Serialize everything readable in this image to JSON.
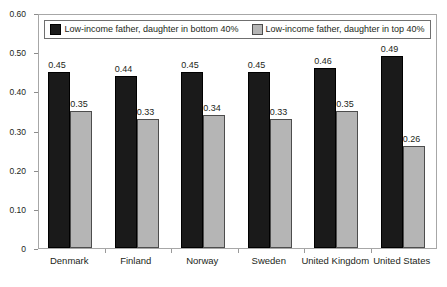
{
  "chart_data": {
    "type": "bar",
    "title": "",
    "subtitle": "",
    "xlabel": "",
    "ylabel": "",
    "categories": [
      "Denmark",
      "Finland",
      "Norway",
      "Sweden",
      "United Kingdom",
      "United States"
    ],
    "series": [
      {
        "name": "Low-income father, daughter in bottom 40%",
        "color": "#1a1a1a",
        "values": [
          0.45,
          0.44,
          0.45,
          0.45,
          0.46,
          0.49
        ],
        "labels": [
          "0.45",
          "0.44",
          "0.45",
          "0.45",
          "0.46",
          "0.49"
        ]
      },
      {
        "name": "Low-income father, daughter in top 40%",
        "color": "#b5b5b5",
        "values": [
          0.35,
          0.33,
          0.34,
          0.33,
          0.35,
          0.26
        ],
        "labels": [
          "0.35",
          "0.33",
          "0.34",
          "0.33",
          "0.35",
          "0.26"
        ]
      }
    ],
    "ylim": [
      0,
      0.6
    ],
    "yticks": [
      0,
      0.1,
      0.2,
      0.3,
      0.4,
      0.5,
      0.6
    ],
    "ytick_labels": [
      "0",
      "0.10",
      "0.20",
      "0.30",
      "0.40",
      "0.50",
      "0.60"
    ],
    "grid": false,
    "legend_position": "top-inside",
    "bar_group_order": [
      "series-a",
      "series-b"
    ]
  },
  "legend": {
    "entries": [
      {
        "label": "Low-income father, daughter in bottom 40%",
        "color": "#1a1a1a"
      },
      {
        "label": "Low-income father, daughter in top 40%",
        "color": "#b5b5b5"
      }
    ]
  }
}
